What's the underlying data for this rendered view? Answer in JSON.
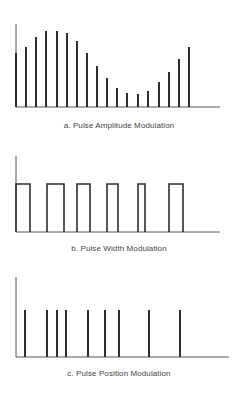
{
  "colors": {
    "line": "#2e2e2e",
    "axis": "#555555",
    "caption": "#444444",
    "background": "#ffffff"
  },
  "panels": [
    {
      "id": "a",
      "caption": "a. Pulse Amplitude Modulation",
      "type": "pam",
      "axis": {
        "x": 16,
        "top": 24,
        "baseline": 107,
        "end": 220
      },
      "bars": [
        {
          "x": 16,
          "top": 53
        },
        {
          "x": 26,
          "top": 47
        },
        {
          "x": 36,
          "top": 37
        },
        {
          "x": 46,
          "top": 31
        },
        {
          "x": 57,
          "top": 31
        },
        {
          "x": 67,
          "top": 33
        },
        {
          "x": 77,
          "top": 41
        },
        {
          "x": 87,
          "top": 53
        },
        {
          "x": 97,
          "top": 66
        },
        {
          "x": 107,
          "top": 78
        },
        {
          "x": 117,
          "top": 88
        },
        {
          "x": 127,
          "top": 93
        },
        {
          "x": 138,
          "top": 94
        },
        {
          "x": 148,
          "top": 91
        },
        {
          "x": 159,
          "top": 82
        },
        {
          "x": 169,
          "top": 72
        },
        {
          "x": 179,
          "top": 59
        },
        {
          "x": 189,
          "top": 47
        }
      ]
    },
    {
      "id": "b",
      "caption": "b. Pulse Width Modulation",
      "type": "pwm",
      "axis": {
        "x": 16,
        "top": 156,
        "baseline": 232,
        "end": 220
      },
      "pulse_top": 184,
      "pulses": [
        {
          "start": 16,
          "end": 30
        },
        {
          "start": 47,
          "end": 64
        },
        {
          "start": 77,
          "end": 90
        },
        {
          "start": 107,
          "end": 118
        },
        {
          "start": 138,
          "end": 145
        },
        {
          "start": 169,
          "end": 183
        }
      ]
    },
    {
      "id": "c",
      "caption": "c. Pulse Position Modulation",
      "type": "ppm",
      "axis": {
        "x": 16,
        "top": 277,
        "baseline": 357,
        "end": 229
      },
      "pulse_top": 310,
      "positions": [
        25,
        47,
        57,
        66,
        88,
        105,
        119,
        149,
        180
      ]
    }
  ],
  "chart_data": [
    {
      "type": "bar",
      "title": "a. Pulse Amplitude Modulation",
      "xlabel": "",
      "ylabel": "",
      "categories": [
        1,
        2,
        3,
        4,
        5,
        6,
        7,
        8,
        9,
        10,
        11,
        12,
        13,
        14,
        15,
        16,
        17,
        18
      ],
      "values": [
        54,
        60,
        70,
        76,
        76,
        74,
        66,
        54,
        41,
        29,
        19,
        14,
        13,
        16,
        25,
        35,
        48,
        60
      ],
      "grid": false
    },
    {
      "type": "line",
      "title": "b. Pulse Width Modulation",
      "pulse_widths": [
        14,
        17,
        13,
        11,
        7,
        14
      ],
      "pulse_starts": [
        16,
        47,
        77,
        107,
        138,
        169
      ],
      "grid": false
    },
    {
      "type": "line",
      "title": "c. Pulse Position Modulation",
      "pulse_positions": [
        25,
        47,
        57,
        66,
        88,
        105,
        119,
        149,
        180
      ],
      "grid": false
    }
  ]
}
